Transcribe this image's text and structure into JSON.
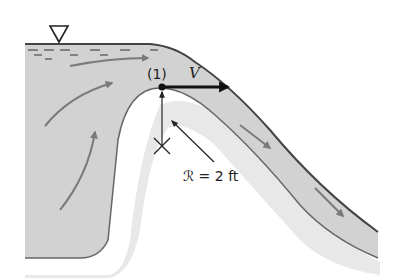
{
  "diagram": {
    "labels": {
      "point": "(1)",
      "velocity": "V",
      "radius": "ℛ = 2 ft"
    },
    "symbols": {
      "free_surface": "free-surface-triangle-icon",
      "center_of_curvature": "x-mark-icon"
    },
    "colors": {
      "water": "#d3d3d3",
      "ground": "#e6e6e6",
      "outline": "#555555",
      "flow_arrow": "#7a7a7a",
      "velocity_arrow": "#111111",
      "text": "#222222"
    }
  }
}
